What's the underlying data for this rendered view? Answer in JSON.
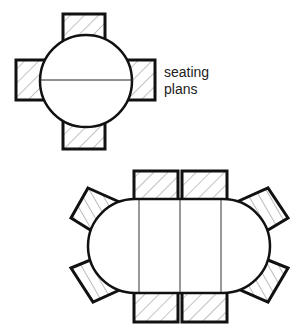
{
  "label": {
    "line1": "seating",
    "line2": "plans"
  },
  "colors": {
    "stroke": "#111111",
    "hatch": "#888888",
    "fill": "#ffffff"
  },
  "round_table": {
    "seats": 4,
    "shape": "circle"
  },
  "oval_table": {
    "seats": 8,
    "shape": "oval",
    "leaves": 2
  }
}
